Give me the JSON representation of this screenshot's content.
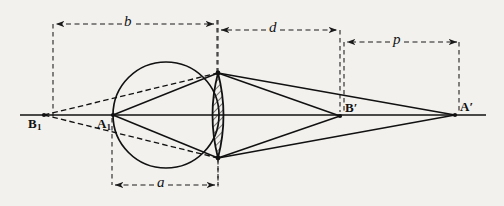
{
  "figure": {
    "kind": "optical-ray-diagram",
    "caption": "",
    "background_color": "#f2f1ee",
    "ink_color": "#111111",
    "canvas": {
      "width": 504,
      "height": 206
    }
  },
  "points": [
    {
      "id": "B1",
      "name": "point-b1",
      "label": "B",
      "subscript": "1",
      "x": 44,
      "y": 115,
      "label_x": 30,
      "label_y": 119
    },
    {
      "id": "A1",
      "name": "point-a1",
      "label": "A",
      "subscript": "1",
      "x": 113,
      "y": 115,
      "label_x": 98,
      "label_y": 119
    },
    {
      "id": "Bp",
      "name": "point-b-prime",
      "label": "B′",
      "subscript": "",
      "x": 340,
      "y": 116,
      "label_x": 344,
      "label_y": 106
    },
    {
      "id": "Ap",
      "name": "point-a-prime",
      "label": "A′",
      "subscript": "",
      "x": 455,
      "y": 115,
      "label_x": 459,
      "label_y": 105
    }
  ],
  "optical_axis": {
    "name": "optical-axis",
    "x1": 20,
    "y1": 115,
    "x2": 486,
    "y2": 115
  },
  "circle": {
    "name": "construction-circle",
    "cx": 166,
    "cy": 115,
    "r": 53
  },
  "lens": {
    "name": "biconvex-lens",
    "top_x": 218,
    "top_y": 73,
    "bottom_x": 218,
    "bottom_y": 158,
    "half_width": 11,
    "hatch_color": "#1a1a1a",
    "hatch_angle": 45
  },
  "dimensions": [
    {
      "id": "b",
      "name": "dimension-b",
      "label": "b",
      "x1": 53,
      "x2": 216,
      "y": 24,
      "label_x": 128,
      "label_y": 12,
      "tick_left_y2": 118,
      "tick_right_y2": 75
    },
    {
      "id": "d",
      "name": "dimension-d",
      "label": "d",
      "x1": 218,
      "x2": 340,
      "y": 30,
      "label_x": 272,
      "label_y": 18,
      "tick_left_y2": 73,
      "tick_right_y2": 112
    },
    {
      "id": "p",
      "name": "dimension-p",
      "label": "p",
      "x1": 344,
      "x2": 460,
      "y": 42,
      "label_x": 396,
      "label_y": 30,
      "tick_left_y2": 112,
      "tick_right_y2": 112
    },
    {
      "id": "a",
      "name": "dimension-a",
      "label": "a",
      "x1": 112,
      "x2": 218,
      "y": 185,
      "label_x": 160,
      "label_y": 172,
      "tick_left_y2": 118,
      "tick_right_y2": 160
    }
  ],
  "rays": {
    "solid_from_a1": [
      {
        "name": "ray-a1-to-lens-top",
        "x1": 113,
        "y1": 115,
        "x2": 218,
        "y2": 73
      },
      {
        "name": "ray-a1-to-lens-bottom",
        "x1": 113,
        "y1": 115,
        "x2": 218,
        "y2": 158
      }
    ],
    "dashed_from_b1": [
      {
        "name": "ray-b1-to-lens-top",
        "x1": 44,
        "y1": 115,
        "x2": 218,
        "y2": 73
      },
      {
        "name": "ray-b1-to-lens-bottom",
        "x1": 44,
        "y1": 115,
        "x2": 218,
        "y2": 158
      }
    ],
    "solid_to_bprime": [
      {
        "name": "ray-lens-top-to-bprime",
        "x1": 218,
        "y1": 73,
        "x2": 340,
        "y2": 116
      },
      {
        "name": "ray-lens-bottom-to-bprime",
        "x1": 218,
        "y1": 158,
        "x2": 340,
        "y2": 116
      }
    ],
    "solid_to_aprime": [
      {
        "name": "ray-lens-top-to-aprime",
        "x1": 218,
        "y1": 73,
        "x2": 455,
        "y2": 115
      },
      {
        "name": "ray-lens-bottom-to-aprime",
        "x1": 218,
        "y1": 158,
        "x2": 455,
        "y2": 115
      }
    ],
    "extensions": [
      {
        "name": "ray-bprime-upper-extension",
        "x1": 340,
        "y1": 116,
        "x2": 455,
        "y2": 115
      }
    ]
  },
  "axis_stub": {
    "name": "axis-left-stub",
    "x1": 20,
    "y1": 115,
    "x2": 44,
    "y2": 115
  }
}
